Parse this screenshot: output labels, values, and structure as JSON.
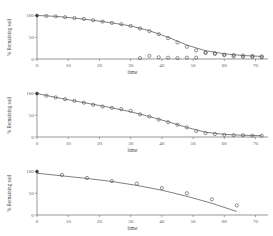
{
  "figure": {
    "panel_count": 3,
    "point_marker": "open-circle",
    "line_color": "#555555",
    "marker_color": "#444444",
    "axis_color": "#6b6b6b"
  },
  "chart_data": [
    {
      "type": "scatter",
      "panel_index": 0,
      "title": "",
      "xlabel": "time",
      "ylabel": "% Remaining soil",
      "xlim": [
        0,
        74
      ],
      "ylim": [
        0,
        108
      ],
      "xticks": [
        0,
        10,
        20,
        30,
        40,
        50,
        60,
        70
      ],
      "xticklabels": [
        "0",
        "10",
        "20",
        "30",
        "40",
        "50",
        "60",
        "70"
      ],
      "yticks": [
        0,
        50,
        100
      ],
      "yticklabels": [
        "0",
        "50",
        "100"
      ],
      "grid": false,
      "legend": "none",
      "series": [
        {
          "name": "observed",
          "marker": "open-circle",
          "x": [
            0,
            3,
            6,
            9,
            12,
            15,
            18,
            21,
            24,
            27,
            30,
            33,
            36,
            39,
            42,
            45,
            48,
            51,
            54,
            57,
            60,
            63,
            66,
            69,
            72
          ],
          "y": [
            100,
            99,
            98,
            96,
            94,
            92,
            89,
            86,
            83,
            80,
            76,
            70,
            64,
            57,
            48,
            38,
            28,
            20,
            15,
            12,
            10,
            9,
            8,
            7,
            6
          ]
        },
        {
          "name": "observed-low",
          "marker": "open-circle",
          "x": [
            33,
            36,
            39,
            42,
            45,
            48,
            51,
            54,
            57,
            60,
            63,
            66,
            69,
            72
          ],
          "y": [
            2,
            7,
            4,
            3,
            2,
            3,
            3,
            14,
            13,
            9,
            6,
            5,
            5,
            4
          ]
        },
        {
          "name": "fitted-curve",
          "marker": "line",
          "x": [
            0,
            6,
            12,
            18,
            24,
            30,
            36,
            42,
            48,
            54,
            60,
            66,
            72
          ],
          "y": [
            100,
            98,
            94,
            89,
            83,
            76,
            65,
            50,
            32,
            19,
            12,
            8,
            6
          ]
        }
      ]
    },
    {
      "type": "scatter",
      "panel_index": 1,
      "title": "",
      "xlabel": "time",
      "ylabel": "% Remaining soil",
      "xlim": [
        0,
        74
      ],
      "ylim": [
        0,
        108
      ],
      "xticks": [
        0,
        10,
        20,
        30,
        40,
        50,
        60,
        70
      ],
      "xticklabels": [
        "0",
        "10",
        "20",
        "30",
        "40",
        "50",
        "60",
        "70"
      ],
      "yticks": [
        0,
        50,
        100
      ],
      "yticklabels": [
        "0",
        "50",
        "100"
      ],
      "grid": false,
      "legend": "none",
      "series": [
        {
          "name": "observed",
          "marker": "open-circle",
          "x": [
            0,
            3,
            6,
            9,
            12,
            15,
            18,
            21,
            24,
            27,
            30,
            33,
            36,
            39,
            42,
            45,
            48,
            51,
            54,
            57,
            60,
            63,
            66,
            69,
            72
          ],
          "y": [
            100,
            95,
            91,
            87,
            83,
            79,
            74,
            70,
            67,
            64,
            60,
            52,
            47,
            40,
            34,
            28,
            22,
            14,
            9,
            7,
            5,
            4,
            4,
            3,
            3
          ]
        },
        {
          "name": "fitted-curve",
          "marker": "line",
          "x": [
            0,
            6,
            12,
            18,
            24,
            30,
            36,
            42,
            48,
            54,
            60,
            66,
            72
          ],
          "y": [
            100,
            91,
            83,
            75,
            67,
            58,
            47,
            35,
            22,
            11,
            6,
            4,
            3
          ]
        }
      ]
    },
    {
      "type": "scatter",
      "panel_index": 2,
      "title": "",
      "xlabel": "time",
      "ylabel": "% Remaining soil",
      "xlim": [
        0,
        74
      ],
      "ylim": [
        0,
        108
      ],
      "xticks": [
        0,
        10,
        20,
        30,
        40,
        50,
        60,
        70
      ],
      "xticklabels": [
        "0",
        "10",
        "20",
        "30",
        "40",
        "50",
        "60",
        "70"
      ],
      "yticks": [
        0,
        50,
        100
      ],
      "yticklabels": [
        "0",
        "50",
        "100"
      ],
      "grid": false,
      "legend": "none",
      "series": [
        {
          "name": "observed",
          "marker": "open-circle",
          "x": [
            0,
            8,
            16,
            24,
            32,
            40,
            48,
            56,
            64
          ],
          "y": [
            100,
            92,
            85,
            78,
            72,
            62,
            50,
            36,
            22
          ]
        },
        {
          "name": "fitted-curve",
          "marker": "line",
          "x": [
            0,
            8,
            16,
            24,
            32,
            40,
            48,
            56,
            64
          ],
          "y": [
            96,
            90,
            84,
            77,
            68,
            57,
            43,
            27,
            8
          ]
        }
      ]
    }
  ]
}
